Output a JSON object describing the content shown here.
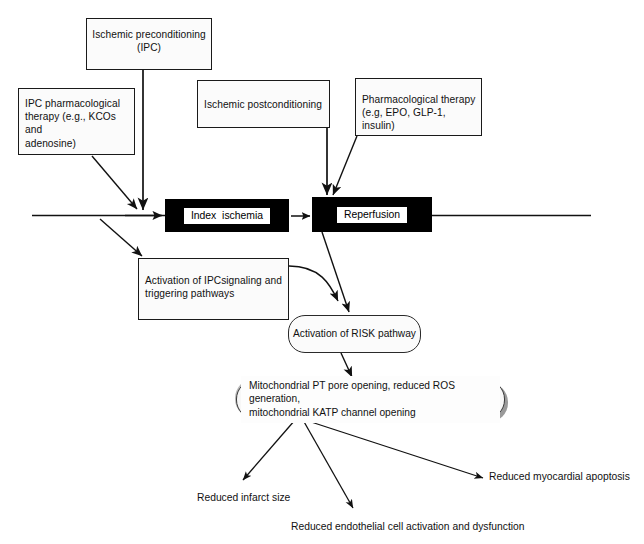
{
  "diagram": {
    "colors": {
      "background": "#ffffff",
      "box_fill": "#fbfbfb",
      "box_border": "#1a1a1a",
      "event_bar": "#000000",
      "event_label_fill": "#ffffff",
      "shadow": "#9a9a9a",
      "arrow": "#111111"
    },
    "interventions": {
      "ischemic_preconditioning": "Ischemic preconditioning\n(IPC)",
      "ipc_pharmacological": "IPC pharmacological\ntherapy (e.g., KCOs and\nadenosine)",
      "ischemic_postconditioning": "Ischemic postconditioning",
      "pharmacological_therapy": "Pharmacological therapy\n(e.g, EPO, GLP-1, insulin)"
    },
    "events": {
      "index_ischemia": "Index  ischemia",
      "reperfusion": "Reperfusion"
    },
    "mechanisms": {
      "ipc_signaling": "Activation of IPCsignaling and\ntriggering pathways",
      "risk_pathway": "Activation of RISK pathway",
      "mitochondrial": "Mitochondrial PT pore opening, reduced ROS generation,\nmitochondrial KATP channel opening"
    },
    "outcomes": [
      "Reduced infarct size",
      "Reduced endothelial cell activation and dysfunction",
      "Reduced myocardial apoptosis"
    ]
  }
}
